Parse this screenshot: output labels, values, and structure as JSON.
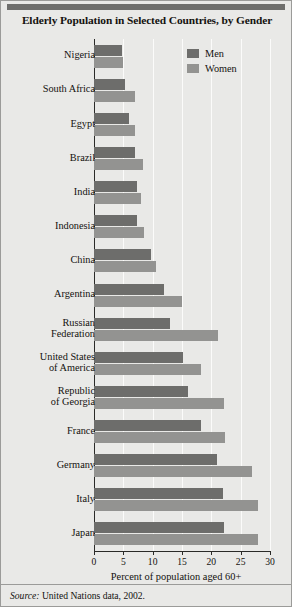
{
  "title": "Elderly Population in Selected Countries, by Gender",
  "source_prefix": "Source:",
  "source_text": "United Nations data, 2002.",
  "legend": {
    "men_label": "Men",
    "women_label": "Women",
    "men_color": "#6d6d6b",
    "women_color": "#939391"
  },
  "chart_data": {
    "type": "bar",
    "orientation": "horizontal",
    "title": "Elderly Population in Selected Countries, by Gender",
    "xlabel": "Percent of population aged 60+",
    "ylabel": "",
    "xlim": [
      0,
      30
    ],
    "xticks": [
      0,
      5,
      10,
      15,
      20,
      25,
      30
    ],
    "xticklabels": [
      "0",
      "5",
      "10",
      "15",
      "20",
      "25",
      "30"
    ],
    "grid": true,
    "legend_position": "upper right",
    "categories": [
      "Nigeria",
      "South Africa",
      "Egypt",
      "Brazil",
      "India",
      "Indonesia",
      "China",
      "Argentina",
      "Russian\nFederation",
      "United States\nof America",
      "Republic\nof Georgia",
      "France",
      "Germany",
      "Italy",
      "Japan"
    ],
    "series": [
      {
        "name": "Men",
        "color": "#6d6d6b",
        "values": [
          4.8,
          5.2,
          6.0,
          7.0,
          7.4,
          7.4,
          9.8,
          12.0,
          13.0,
          15.2,
          16.0,
          18.2,
          21.0,
          22.0,
          22.2
        ]
      },
      {
        "name": "Women",
        "color": "#939391",
        "values": [
          4.9,
          7.0,
          7.0,
          8.4,
          8.0,
          8.6,
          10.6,
          15.0,
          21.2,
          18.2,
          22.2,
          22.4,
          27.0,
          28.0,
          28.0
        ]
      }
    ]
  }
}
